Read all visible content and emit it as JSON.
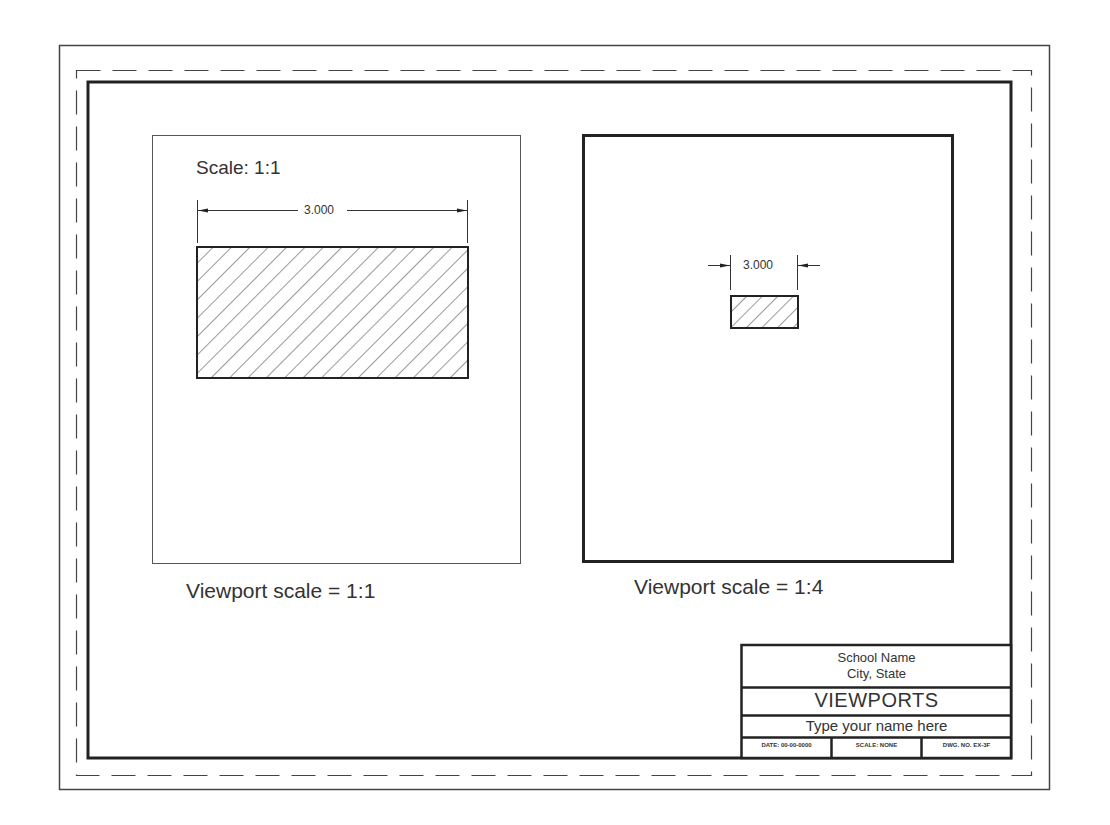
{
  "drawing": {
    "left_viewport": {
      "scale_note": "Scale: 1:1",
      "dimension": "3.000",
      "caption": "Viewport scale = 1:1"
    },
    "right_viewport": {
      "dimension": "3.000",
      "caption": "Viewport scale = 1:4"
    }
  },
  "title_block": {
    "school": "School Name",
    "location": "City, State",
    "title": "VIEWPORTS",
    "name_field": "Type your name here",
    "date": "DATE: 00-00-0000",
    "scale": "SCALE: NONE",
    "dwg_no": "DWG. NO. EX-3F"
  },
  "colors": {
    "line": "#2a2a2a",
    "paper": "#ffffff"
  }
}
